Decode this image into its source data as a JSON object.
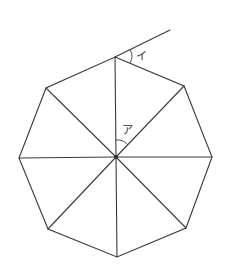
{
  "diagram": {
    "title": "",
    "shape": "regular octagon divided into 8 triangles from center",
    "colors": {
      "stroke": "#3a3a3a",
      "background": "#ffffff",
      "label": "#333333"
    },
    "center": [
      116,
      157
    ],
    "vertices": [
      [
        115,
        57
      ],
      [
        184,
        86
      ],
      [
        212,
        157
      ],
      [
        186,
        228
      ],
      [
        117,
        257
      ],
      [
        48,
        229
      ],
      [
        19,
        158
      ],
      [
        46,
        88
      ]
    ],
    "extension_line": {
      "from": [
        115,
        57
      ],
      "to": [
        170,
        30
      ]
    },
    "labels": {
      "angle_a": "ア",
      "angle_i": "イ"
    }
  }
}
